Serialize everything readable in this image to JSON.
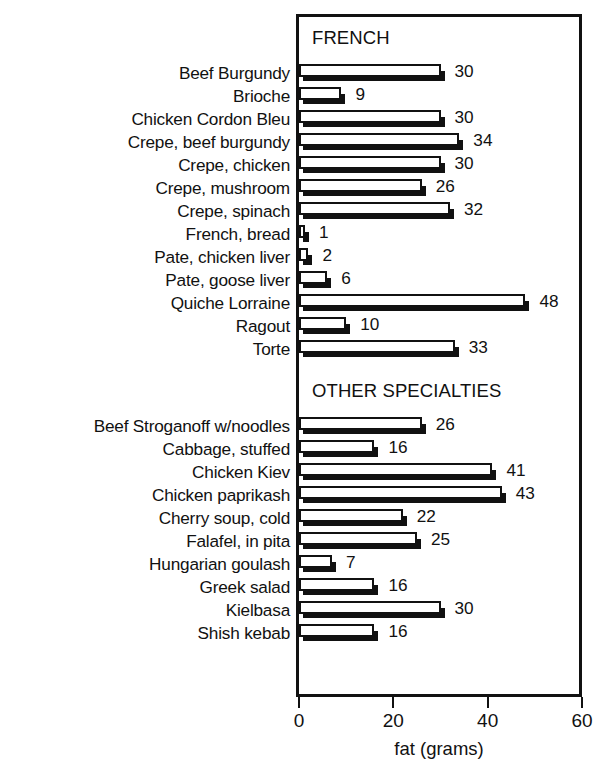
{
  "chart_data": {
    "type": "bar",
    "orientation": "horizontal",
    "title": "",
    "xlabel": "fat (grams)",
    "ylabel": "",
    "xlim": [
      0,
      60
    ],
    "xticks": [
      0,
      20,
      40,
      60
    ],
    "xtick_labels": [
      "0",
      "20",
      "40",
      "60"
    ],
    "grid": false,
    "legend": null,
    "value_labels": true,
    "units": "grams",
    "groups": [
      {
        "name": "FRENCH",
        "categories": [
          "Beef Burgundy",
          "Brioche",
          "Chicken Cordon Bleu",
          "Crepe, beef burgundy",
          "Crepe, chicken",
          "Crepe, mushroom",
          "Crepe, spinach",
          "French, bread",
          "Pate, chicken liver",
          "Pate, goose liver",
          "Quiche Lorraine",
          "Ragout",
          "Torte"
        ],
        "values": [
          30,
          9,
          30,
          34,
          30,
          26,
          32,
          1,
          2,
          6,
          48,
          10,
          33
        ]
      },
      {
        "name": "OTHER SPECIALTIES",
        "categories": [
          "Beef Stroganoff w/noodles",
          "Cabbage, stuffed",
          "Chicken Kiev",
          "Chicken paprikash",
          "Cherry soup, cold",
          "Falafel, in pita",
          "Hungarian goulash",
          "Greek salad",
          "Kielbasa",
          "Shish kebab"
        ],
        "values": [
          26,
          16,
          41,
          43,
          22,
          25,
          7,
          16,
          30,
          16
        ]
      }
    ],
    "categories": [
      "Beef Burgundy",
      "Brioche",
      "Chicken Cordon Bleu",
      "Crepe, beef burgundy",
      "Crepe, chicken",
      "Crepe, mushroom",
      "Crepe, spinach",
      "French, bread",
      "Pate, chicken liver",
      "Pate, goose liver",
      "Quiche Lorraine",
      "Ragout",
      "Torte",
      "Beef Stroganoff w/noodles",
      "Cabbage, stuffed",
      "Chicken Kiev",
      "Chicken paprikash",
      "Cherry soup, cold",
      "Falafel, in pita",
      "Hungarian goulash",
      "Greek salad",
      "Kielbasa",
      "Shish kebab"
    ],
    "values": [
      30,
      9,
      30,
      34,
      30,
      26,
      32,
      1,
      2,
      6,
      48,
      10,
      33,
      26,
      16,
      41,
      43,
      22,
      25,
      7,
      16,
      30,
      16
    ],
    "colors": {
      "bar_fill": "#ffffff",
      "bar_outline": "#111111",
      "bar_shadow": "#111111",
      "axis": "#111111",
      "text": "#111111",
      "background": "#ffffff"
    }
  }
}
